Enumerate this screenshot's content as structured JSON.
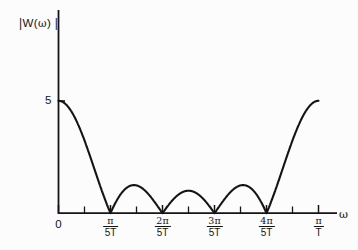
{
  "figure": {
    "background_color": "#fcfcfc",
    "line_color": "#141414",
    "axis_color": "#141414"
  },
  "axes": {
    "y_title": {
      "left_bar": "|",
      "text": "W(",
      "omega": "ω",
      "close": ")",
      "right_bar": "|",
      "full": "| W(ω) |"
    },
    "x_title": "ω",
    "y_ticks": [
      {
        "label": "5",
        "value": 5
      }
    ],
    "x_ticks": [
      {
        "label": "0",
        "type": "simple",
        "value": 0
      },
      {
        "numerator": "π",
        "denominator": "5T",
        "type": "fraction",
        "value": 1
      },
      {
        "numerator": "2π",
        "denominator": "5T",
        "type": "fraction",
        "value": 2
      },
      {
        "numerator": "3π",
        "denominator": "5T",
        "type": "fraction",
        "value": 3
      },
      {
        "numerator": "4π",
        "denominator": "5T",
        "type": "fraction",
        "value": 4
      },
      {
        "numerator": "π",
        "denominator": "T",
        "type": "fraction",
        "value": 5
      }
    ]
  },
  "chart_data": {
    "type": "line",
    "title": "",
    "xlabel": "ω",
    "ylabel": "| W(ω) |",
    "xlim": [
      0,
      5.5
    ],
    "ylim": [
      0,
      5.6
    ],
    "x_tick_labels": [
      "0",
      "π/5T",
      "2π/5T",
      "3π/5T",
      "4π/5T",
      "π/T"
    ],
    "x_tick_values": [
      0,
      1,
      2,
      3,
      4,
      5
    ],
    "y_tick_labels": [
      "5"
    ],
    "y_tick_values": [
      5
    ],
    "grid": false,
    "legend": null,
    "series": [
      {
        "name": "|W(ω)|",
        "x": [
          0.0,
          0.1,
          0.2,
          0.3,
          0.4,
          0.5,
          0.6,
          0.7,
          0.8,
          0.9,
          1.0,
          1.1,
          1.2,
          1.3,
          1.4,
          1.5,
          1.6,
          1.7,
          1.8,
          1.9,
          2.0,
          2.1,
          2.2,
          2.3,
          2.4,
          2.5,
          2.6,
          2.7,
          2.8,
          2.9,
          3.0,
          3.1,
          3.2,
          3.3,
          3.4,
          3.5,
          3.6,
          3.7,
          3.8,
          3.9,
          4.0,
          4.1,
          4.2,
          4.3,
          4.4,
          4.5,
          4.6,
          4.7,
          4.8,
          4.9,
          5.0
        ],
        "y": [
          5.0,
          4.94,
          4.76,
          4.47,
          4.07,
          3.59,
          3.04,
          2.43,
          1.79,
          1.13,
          0.0,
          0.35,
          0.66,
          0.87,
          0.99,
          1.01,
          0.97,
          0.84,
          0.64,
          0.38,
          0.0,
          0.32,
          0.58,
          0.79,
          0.92,
          0.96,
          0.92,
          0.79,
          0.58,
          0.32,
          0.0,
          0.38,
          0.64,
          0.84,
          0.97,
          1.01,
          0.99,
          0.87,
          0.66,
          0.35,
          0.0,
          1.13,
          1.79,
          2.43,
          3.04,
          3.59,
          4.07,
          4.47,
          4.76,
          4.94,
          5.0
        ],
        "peak_main_lobe": 5,
        "peak_side_lobe": 1,
        "zeros_at": [
          1,
          2,
          3,
          4
        ]
      }
    ]
  }
}
